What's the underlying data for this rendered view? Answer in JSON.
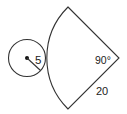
{
  "diagram": {
    "type": "geometry",
    "circle": {
      "radius_label": "5",
      "center_dot": true
    },
    "sector": {
      "angle_label": "90°",
      "radius_label": "20"
    },
    "colors": {
      "stroke": "#333333",
      "text": "#222222",
      "background": "#ffffff"
    }
  }
}
